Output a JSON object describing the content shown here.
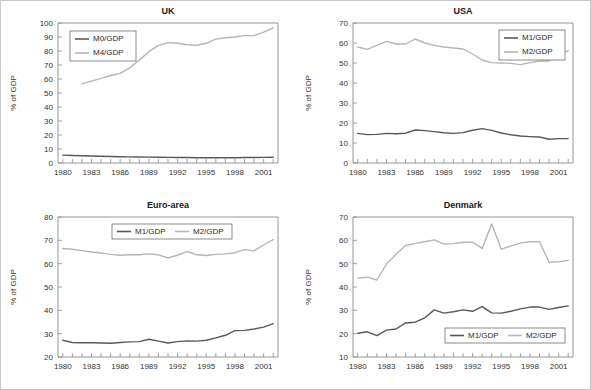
{
  "figure": {
    "width": 591,
    "height": 390,
    "background": "#ffffff",
    "border_color": "#c8c8c8"
  },
  "colors": {
    "dark_series": "#595959",
    "light_series": "#b5b5b5",
    "axis": "#8a8a8a",
    "text": "#333333",
    "title": "#1a1a1a"
  },
  "chart_data": [
    {
      "id": "uk",
      "type": "line",
      "title": "UK",
      "xlabel": "",
      "ylabel": "% of GDP",
      "xlim": [
        1979.5,
        2002.5
      ],
      "ylim": [
        0,
        100
      ],
      "yticks": [
        0,
        10,
        20,
        30,
        40,
        50,
        60,
        70,
        80,
        90,
        100
      ],
      "xticks": [
        1980,
        1983,
        1986,
        1989,
        1992,
        1995,
        1998,
        2001
      ],
      "xticks_minor_step": 1,
      "grid": false,
      "legend_position": "top-left",
      "x": [
        1980,
        1981,
        1982,
        1983,
        1984,
        1985,
        1986,
        1987,
        1988,
        1989,
        1990,
        1991,
        1992,
        1993,
        1994,
        1995,
        1996,
        1997,
        1998,
        1999,
        2000,
        2001,
        2002
      ],
      "series": [
        {
          "name": "M0/GDP",
          "color": "#595959",
          "values": [
            5.6,
            5.4,
            5.2,
            5.0,
            4.8,
            4.6,
            4.5,
            4.4,
            4.3,
            4.2,
            4.1,
            4.0,
            3.9,
            3.9,
            3.8,
            3.8,
            3.8,
            3.8,
            3.8,
            3.9,
            3.9,
            4.0,
            4.1
          ]
        },
        {
          "name": "M4/GDP",
          "color": "#b5b5b5",
          "values": [
            null,
            null,
            56.5,
            58.5,
            60.5,
            62.5,
            64.0,
            68.0,
            73.5,
            79.5,
            84.0,
            86.0,
            85.5,
            84.5,
            84.0,
            85.5,
            88.5,
            89.5,
            90.0,
            91.0,
            91.0,
            93.5,
            96.5
          ]
        }
      ]
    },
    {
      "id": "usa",
      "type": "line",
      "title": "USA",
      "xlabel": "",
      "ylabel": "% of GDP",
      "xlim": [
        1979.5,
        2002.5
      ],
      "ylim": [
        0,
        70
      ],
      "yticks": [
        0,
        10,
        20,
        30,
        40,
        50,
        60,
        70
      ],
      "xticks": [
        1980,
        1983,
        1986,
        1989,
        1992,
        1995,
        1998,
        2001
      ],
      "xticks_minor_step": 1,
      "grid": false,
      "legend_position": "top-right",
      "x": [
        1980,
        1981,
        1982,
        1983,
        1984,
        1985,
        1986,
        1987,
        1988,
        1989,
        1990,
        1991,
        1992,
        1993,
        1994,
        1995,
        1996,
        1997,
        1998,
        1999,
        2000,
        2001,
        2002
      ],
      "series": [
        {
          "name": "M1/GDP",
          "color": "#595959",
          "values": [
            14.8,
            14.2,
            14.3,
            14.8,
            14.6,
            14.9,
            16.5,
            16.2,
            15.7,
            15.1,
            14.8,
            15.2,
            16.4,
            17.2,
            16.3,
            15.0,
            14.1,
            13.5,
            13.2,
            13.0,
            11.9,
            12.2,
            12.2
          ]
        },
        {
          "name": "M2/GDP",
          "color": "#b5b5b5",
          "values": [
            58.0,
            56.8,
            58.8,
            60.8,
            59.5,
            59.5,
            62.0,
            60.0,
            58.8,
            58.0,
            57.5,
            57.0,
            54.5,
            51.5,
            50.2,
            50.0,
            49.8,
            49.2,
            50.2,
            51.0,
            51.0,
            54.0,
            56.2
          ]
        }
      ]
    },
    {
      "id": "euro",
      "type": "line",
      "title": "Euro-area",
      "xlabel": "",
      "ylabel": "% of GDP",
      "xlim": [
        1979.5,
        2002.5
      ],
      "ylim": [
        20,
        80
      ],
      "yticks": [
        20,
        30,
        40,
        50,
        60,
        70,
        80
      ],
      "xticks": [
        1980,
        1983,
        1986,
        1989,
        1992,
        1995,
        1998,
        2001
      ],
      "xticks_minor_step": 1,
      "grid": false,
      "legend_position": "top-center",
      "x": [
        1980,
        1981,
        1982,
        1983,
        1984,
        1985,
        1986,
        1987,
        1988,
        1989,
        1990,
        1991,
        1992,
        1993,
        1994,
        1995,
        1996,
        1997,
        1998,
        1999,
        2000,
        2001,
        2002
      ],
      "series": [
        {
          "name": "M1/GDP",
          "color": "#595959",
          "values": [
            27.2,
            26.2,
            26.1,
            26.1,
            26.0,
            25.9,
            26.2,
            26.5,
            26.6,
            27.6,
            26.8,
            26.0,
            26.6,
            26.9,
            26.8,
            27.2,
            28.2,
            29.3,
            31.3,
            31.4,
            32.0,
            32.8,
            34.3
          ]
        },
        {
          "name": "M2/GDP",
          "color": "#b5b5b5",
          "values": [
            66.5,
            66.2,
            65.6,
            65.0,
            64.6,
            64.0,
            63.6,
            63.8,
            63.8,
            64.2,
            63.8,
            62.5,
            63.6,
            65.2,
            63.8,
            63.5,
            64.0,
            64.2,
            64.7,
            66.0,
            65.5,
            68.0,
            70.3
          ]
        }
      ]
    },
    {
      "id": "denmark",
      "type": "line",
      "title": "Denmark",
      "xlabel": "",
      "ylabel": "% of GDP",
      "xlim": [
        1979.5,
        2002.5
      ],
      "ylim": [
        10,
        70
      ],
      "yticks": [
        10,
        20,
        30,
        40,
        50,
        60,
        70
      ],
      "xticks": [
        1980,
        1983,
        1986,
        1989,
        1992,
        1995,
        1998,
        2001
      ],
      "xticks_minor_step": 1,
      "grid": false,
      "legend_position": "bottom-right",
      "x": [
        1980,
        1981,
        1982,
        1983,
        1984,
        1985,
        1986,
        1987,
        1988,
        1989,
        1990,
        1991,
        1992,
        1993,
        1994,
        1995,
        1996,
        1997,
        1998,
        1999,
        2000,
        2001,
        2002
      ],
      "series": [
        {
          "name": "M1/GDP",
          "color": "#595959",
          "values": [
            20.2,
            20.8,
            19.2,
            21.5,
            22.0,
            24.6,
            24.9,
            26.8,
            30.2,
            28.8,
            29.4,
            30.2,
            29.6,
            31.6,
            28.9,
            28.8,
            29.6,
            30.6,
            31.4,
            31.4,
            30.4,
            31.2,
            31.9
          ]
        },
        {
          "name": "M2/GDP",
          "color": "#b5b5b5",
          "values": [
            43.8,
            44.2,
            43.0,
            49.8,
            54.0,
            57.8,
            58.6,
            59.4,
            60.2,
            58.4,
            58.6,
            59.2,
            59.2,
            56.5,
            67.0,
            56.2,
            57.6,
            58.8,
            59.4,
            59.4,
            50.6,
            50.8,
            51.4
          ]
        }
      ]
    }
  ]
}
